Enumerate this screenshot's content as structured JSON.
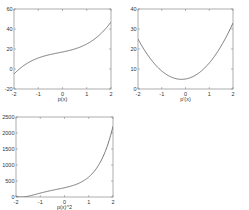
{
  "figure": {
    "background": "#ffffff",
    "line_color": "#555555",
    "axis_color": "#777777"
  },
  "chart_data": [
    {
      "type": "line",
      "title": "",
      "xlabel": "p(x)",
      "ylabel": "",
      "xlim": [
        -2,
        2
      ],
      "ylim": [
        -20,
        60
      ],
      "xticks": [
        -2,
        -1,
        0,
        1,
        2
      ],
      "yticks": [
        -20,
        0,
        20,
        40,
        60
      ],
      "grid": false,
      "x": [
        -2,
        -1.5,
        -1,
        -0.5,
        0,
        0.5,
        1,
        1.5,
        2
      ],
      "values": [
        -5,
        3.5,
        9,
        14.25,
        17,
        20.25,
        25,
        33.5,
        47
      ],
      "formula": "2x^3 + x^2 + 5x + 17",
      "frame": {
        "left": 14,
        "top": 9,
        "right": 111,
        "bottom": 89
      }
    },
    {
      "type": "line",
      "title": "",
      "xlabel": "p'(x)",
      "ylabel": "",
      "xlim": [
        -2,
        2
      ],
      "ylim": [
        0,
        40
      ],
      "xticks": [
        -2,
        -1,
        0,
        1,
        2
      ],
      "yticks": [
        0,
        10,
        20,
        30,
        40
      ],
      "grid": false,
      "x": [
        -2,
        -1.5,
        -1,
        -0.5,
        0,
        0.5,
        1,
        1.5,
        2
      ],
      "values": [
        25,
        15.5,
        9,
        5.5,
        5,
        7.5,
        13,
        21.5,
        33
      ],
      "formula": "6x^2 + 2x + 5",
      "frame": {
        "left": 138,
        "top": 9,
        "right": 233,
        "bottom": 89
      }
    },
    {
      "type": "line",
      "title": "",
      "xlabel": "p(x)^2",
      "ylabel": "",
      "xlim": [
        -2,
        2
      ],
      "ylim": [
        0,
        2500
      ],
      "xticks": [
        -2,
        -1,
        0,
        1,
        2
      ],
      "yticks": [
        0,
        500,
        1000,
        1500,
        2000,
        2500
      ],
      "grid": false,
      "x": [
        -2,
        -1.5,
        -1,
        -0.5,
        0,
        0.5,
        1,
        1.5,
        2
      ],
      "values": [
        25,
        12.25,
        81,
        203,
        289,
        410,
        625,
        1122,
        2209
      ],
      "formula": "(2x^3 + x^2 + 5x + 17)^2",
      "frame": {
        "left": 16,
        "top": 117,
        "right": 113,
        "bottom": 197
      }
    }
  ]
}
